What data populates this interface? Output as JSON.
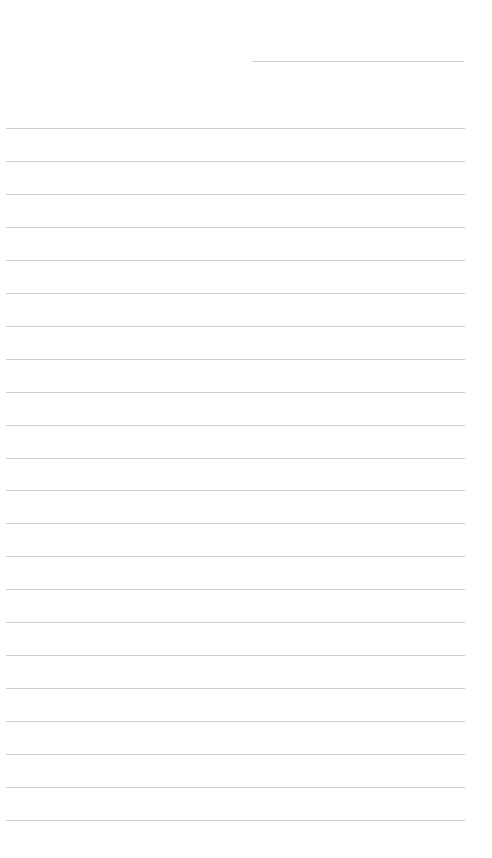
{
  "page": {
    "type": "lined-notebook-page",
    "background_color": "#ffffff",
    "line_color": "#cfcfcf"
  },
  "date_line": {
    "x_start": 252,
    "x_end": 464,
    "y": 61
  },
  "ruled_lines": {
    "x_start": 6,
    "x_end": 465,
    "first_y": 128,
    "last_y": 820,
    "count": 22
  }
}
